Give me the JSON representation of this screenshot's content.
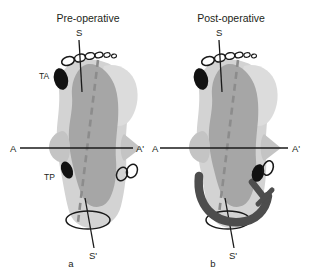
{
  "figure": {
    "type": "anatomical-diagram",
    "width": 321,
    "height": 279
  },
  "colors": {
    "background": "#ffffff",
    "outer_body": "#d3d3d3",
    "inner_body": "#a6a6a6",
    "wing": "#c4c4c4",
    "marker_filled": "#111111",
    "axis_line": "#1a1a1a",
    "dashed_axis": "#8c8c8c",
    "implant": "#4d4d4d",
    "text": "#231f20"
  },
  "panels": [
    {
      "id": "a",
      "title": "Pre-operative",
      "letter": "a",
      "axes": {
        "vertical": {
          "top_label": "S",
          "bottom_label": "S'"
        },
        "horizontal": {
          "left_label": "A",
          "right_label": "A'"
        }
      },
      "labels": [
        {
          "name": "TA",
          "text": "TA"
        },
        {
          "name": "TP",
          "text": "TP"
        }
      ],
      "has_implant": false
    },
    {
      "id": "b",
      "title": "Post-operative",
      "letter": "b",
      "axes": {
        "vertical": {
          "top_label": "S",
          "bottom_label": "S'"
        },
        "horizontal": {
          "left_label": "A",
          "right_label": "A'"
        }
      },
      "labels": [],
      "has_implant": true
    }
  ]
}
